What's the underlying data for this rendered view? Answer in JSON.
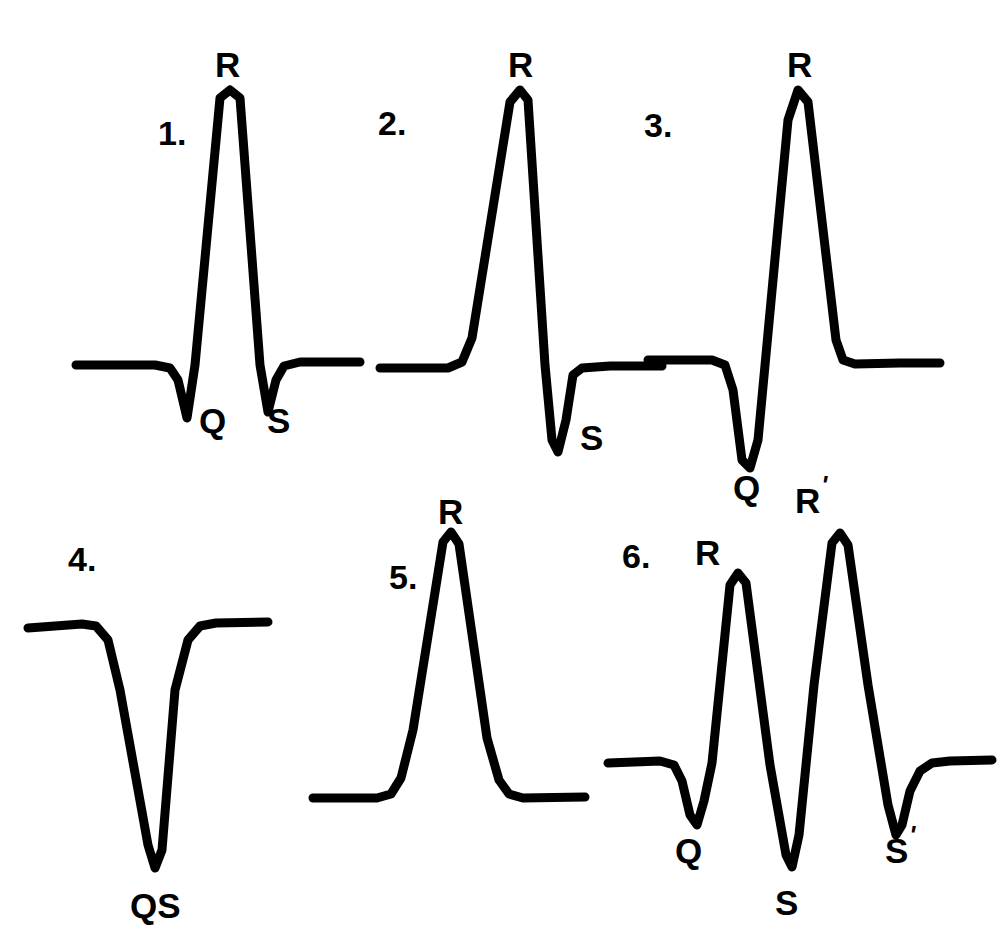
{
  "figure": {
    "background_color": "#ffffff",
    "stroke_color": "#000000",
    "width": 923,
    "height": 946
  },
  "chart_data": {
    "type": "line",
    "xlabel": "",
    "ylabel": "",
    "grid": false,
    "legend": "none",
    "series": [
      {
        "name": "1",
        "index_label": "1.",
        "morphology": "qRs",
        "deflections": [
          "Q",
          "R",
          "S"
        ],
        "points": [
          [
            16,
            345
          ],
          [
            95,
            345
          ],
          [
            110,
            348
          ],
          [
            118,
            360
          ],
          [
            127,
            398
          ],
          [
            135,
            345
          ],
          [
            160,
            78
          ],
          [
            170,
            70
          ],
          [
            180,
            78
          ],
          [
            200,
            345
          ],
          [
            208,
            392
          ],
          [
            216,
            360
          ],
          [
            224,
            346
          ],
          [
            240,
            342
          ],
          [
            300,
            342
          ]
        ]
      },
      {
        "name": "2",
        "index_label": "2.",
        "morphology": "RS",
        "deflections": [
          "R",
          "S"
        ],
        "points": [
          [
            10,
            348
          ],
          [
            78,
            348
          ],
          [
            92,
            342
          ],
          [
            102,
            318
          ],
          [
            140,
            82
          ],
          [
            150,
            70
          ],
          [
            158,
            80
          ],
          [
            175,
            345
          ],
          [
            182,
            420
          ],
          [
            188,
            432
          ],
          [
            196,
            400
          ],
          [
            203,
            355
          ],
          [
            212,
            348
          ],
          [
            240,
            346
          ],
          [
            292,
            346
          ]
        ]
      },
      {
        "name": "3",
        "index_label": "3.",
        "morphology": "QR",
        "deflections": [
          "Q",
          "R"
        ],
        "points": [
          [
            8,
            340
          ],
          [
            72,
            340
          ],
          [
            85,
            345
          ],
          [
            93,
            370
          ],
          [
            102,
            440
          ],
          [
            110,
            448
          ],
          [
            118,
            420
          ],
          [
            148,
            100
          ],
          [
            158,
            70
          ],
          [
            168,
            82
          ],
          [
            196,
            320
          ],
          [
            203,
            340
          ],
          [
            215,
            344
          ],
          [
            260,
            343
          ],
          [
            300,
            343
          ]
        ]
      },
      {
        "name": "4",
        "index_label": "4.",
        "morphology": "QS",
        "deflections": [
          "QS"
        ],
        "points": [
          [
            8,
            128
          ],
          [
            62,
            124
          ],
          [
            76,
            126
          ],
          [
            88,
            140
          ],
          [
            100,
            190
          ],
          [
            128,
            345
          ],
          [
            135,
            368
          ],
          [
            142,
            350
          ],
          [
            155,
            190
          ],
          [
            168,
            140
          ],
          [
            180,
            126
          ],
          [
            196,
            123
          ],
          [
            248,
            122
          ]
        ]
      },
      {
        "name": "5",
        "index_label": "5.",
        "morphology": "R",
        "deflections": [
          "R"
        ],
        "points": [
          [
            8,
            298
          ],
          [
            72,
            298
          ],
          [
            86,
            294
          ],
          [
            96,
            278
          ],
          [
            108,
            230
          ],
          [
            138,
            42
          ],
          [
            146,
            32
          ],
          [
            154,
            44
          ],
          [
            182,
            238
          ],
          [
            194,
            280
          ],
          [
            204,
            294
          ],
          [
            218,
            298
          ],
          [
            280,
            297
          ]
        ]
      },
      {
        "name": "6",
        "index_label": "6.",
        "morphology": "qRsR's'",
        "deflections": [
          "Q",
          "R",
          "S",
          "R'",
          "S'"
        ],
        "points": [
          [
            8,
            278
          ],
          [
            60,
            276
          ],
          [
            74,
            280
          ],
          [
            82,
            296
          ],
          [
            90,
            330
          ],
          [
            97,
            340
          ],
          [
            104,
            316
          ],
          [
            112,
            278
          ],
          [
            130,
            100
          ],
          [
            138,
            88
          ],
          [
            146,
            98
          ],
          [
            170,
            280
          ],
          [
            186,
            370
          ],
          [
            192,
            382
          ],
          [
            199,
            350
          ],
          [
            214,
            200
          ],
          [
            232,
            58
          ],
          [
            240,
            48
          ],
          [
            248,
            60
          ],
          [
            268,
            200
          ],
          [
            288,
            320
          ],
          [
            296,
            350
          ],
          [
            302,
            340
          ],
          [
            310,
            306
          ],
          [
            320,
            286
          ],
          [
            332,
            278
          ],
          [
            350,
            276
          ],
          [
            392,
            275
          ]
        ]
      }
    ]
  },
  "panels": [
    {
      "id": "panel-1",
      "index_label": "1.",
      "index_pos": {
        "x": 98,
        "y": 96
      },
      "labels": [
        {
          "text": "R",
          "prime": "",
          "x": 155,
          "y": 27,
          "name": "r-wave-label"
        },
        {
          "text": "Q",
          "prime": "",
          "x": 139,
          "y": 383,
          "name": "q-wave-label"
        },
        {
          "text": "S",
          "prime": "",
          "x": 207,
          "y": 383,
          "name": "s-wave-label"
        }
      ]
    },
    {
      "id": "panel-2",
      "index_label": "2.",
      "index_pos": {
        "x": 8,
        "y": 86
      },
      "labels": [
        {
          "text": "R",
          "prime": "",
          "x": 138,
          "y": 27,
          "name": "r-wave-label"
        },
        {
          "text": "S",
          "prime": "",
          "x": 210,
          "y": 400,
          "name": "s-wave-label"
        }
      ]
    },
    {
      "id": "panel-3",
      "index_label": "3.",
      "index_pos": {
        "x": 4,
        "y": 88
      },
      "labels": [
        {
          "text": "R",
          "prime": "",
          "x": 147,
          "y": 27,
          "name": "r-wave-label"
        },
        {
          "text": "Q",
          "prime": "",
          "x": 93,
          "y": 450,
          "name": "q-wave-label"
        }
      ]
    },
    {
      "id": "panel-4",
      "index_label": "4.",
      "index_pos": {
        "x": 48,
        "y": 42
      },
      "labels": [
        {
          "text": "QS",
          "prime": "",
          "x": 110,
          "y": 388,
          "name": "qs-wave-label"
        }
      ]
    },
    {
      "id": "panel-5",
      "index_label": "5.",
      "index_pos": {
        "x": 84,
        "y": 60
      },
      "labels": [
        {
          "text": "R",
          "prime": "",
          "x": 133,
          "y": -6,
          "name": "r-wave-label"
        }
      ]
    },
    {
      "id": "panel-6",
      "index_label": "6.",
      "index_pos": {
        "x": 22,
        "y": 54
      },
      "labels": [
        {
          "text": "R",
          "prime": "",
          "x": 95,
          "y": 50,
          "name": "r-wave-label"
        },
        {
          "text": "R",
          "prime": "'",
          "x": 195,
          "y": -2,
          "name": "r-prime-wave-label"
        },
        {
          "text": "Q",
          "prime": "",
          "x": 75,
          "y": 348,
          "name": "q-wave-label"
        },
        {
          "text": "S",
          "prime": "",
          "x": 175,
          "y": 400,
          "name": "s-wave-label"
        },
        {
          "text": "S",
          "prime": "'",
          "x": 285,
          "y": 348,
          "name": "s-prime-wave-label"
        }
      ]
    }
  ]
}
